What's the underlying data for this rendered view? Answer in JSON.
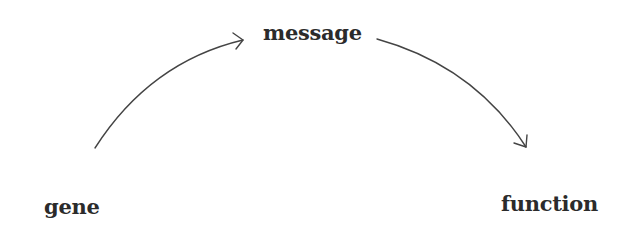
{
  "diagram": {
    "type": "flow",
    "nodes": [
      {
        "id": "gene",
        "label": "gene"
      },
      {
        "id": "message",
        "label": "message"
      },
      {
        "id": "function",
        "label": "function"
      }
    ],
    "edges": [
      {
        "from": "gene",
        "to": "message",
        "style": "curved-arrow"
      },
      {
        "from": "message",
        "to": "function",
        "style": "curved-arrow"
      }
    ],
    "colors": {
      "text": "#2b2b2b",
      "arrow": "#444444",
      "background": "#ffffff"
    }
  }
}
